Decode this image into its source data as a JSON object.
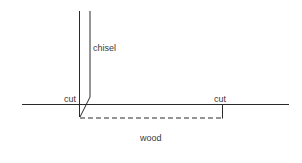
{
  "diagram": {
    "labels": {
      "chisel": "chisel",
      "cut_left": "cut",
      "cut_right": "cut",
      "wood": "wood"
    },
    "colors": {
      "line": "#2a2a2a",
      "text": "#3a3a3a",
      "background": "#ffffff"
    },
    "elements": {
      "chisel_left_edge": {
        "x1": 79.5,
        "y1": 11,
        "x2": 79.5,
        "y2": 117
      },
      "chisel_right_edge": {
        "x1": 90,
        "y1": 11,
        "x2": 90,
        "y2": 97
      },
      "chisel_bevel": {
        "x1": 90,
        "y1": 97,
        "x2": 80,
        "y2": 117
      },
      "wood_surface": {
        "x1": 22,
        "y1": 104.5,
        "x2": 289,
        "y2": 104.5
      },
      "cut_depth_dashed": {
        "x1": 80,
        "y1": 118,
        "x2": 222,
        "y2": 118
      },
      "cut_right_marker": {
        "x1": 222.5,
        "y1": 104.5,
        "x2": 222.5,
        "y2": 118
      }
    }
  }
}
